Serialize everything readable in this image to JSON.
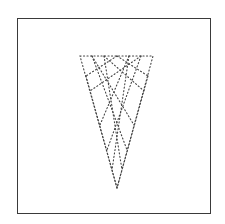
{
  "diagram": {
    "frame": {
      "x": 17,
      "y": 18,
      "width": 194,
      "height": 196,
      "color": "#3a3a3a"
    },
    "triangle": {
      "top_left": [
        80,
        56
      ],
      "top_right": [
        153,
        56
      ],
      "apex": [
        117,
        188
      ],
      "stroke_color": "#444444",
      "style": "dotted"
    },
    "lattice_lines": [
      {
        "from": [
          92,
          56
        ],
        "to": [
          134,
          125
        ]
      },
      {
        "from": [
          104,
          56
        ],
        "to": [
          144,
          91
        ]
      },
      {
        "from": [
          117,
          56
        ],
        "to": [
          148,
          76
        ]
      },
      {
        "from": [
          129,
          56
        ],
        "to": [
          100,
          125
        ]
      },
      {
        "from": [
          141,
          56
        ],
        "to": [
          90,
          91
        ]
      },
      {
        "from": [
          117,
          56
        ],
        "to": [
          86,
          76
        ]
      },
      {
        "from": [
          92,
          56
        ],
        "to": [
          127,
          150
        ]
      },
      {
        "from": [
          141,
          56
        ],
        "to": [
          107,
          150
        ]
      },
      {
        "from": [
          104,
          56
        ],
        "to": [
          122,
          170
        ]
      },
      {
        "from": [
          129,
          56
        ],
        "to": [
          112,
          170
        ]
      },
      {
        "from": [
          86,
          76
        ],
        "to": [
          117,
          188
        ]
      },
      {
        "from": [
          148,
          76
        ],
        "to": [
          117,
          188
        ]
      }
    ]
  }
}
